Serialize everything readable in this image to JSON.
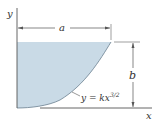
{
  "diagram": {
    "axis_labels": {
      "x": "x",
      "y": "y"
    },
    "dimensions": {
      "width": "a",
      "height": "b"
    },
    "curve": {
      "equation_prefix": "y = kx",
      "exponent": "3/2"
    },
    "colors": {
      "fill": "#c9dae6",
      "stroke": "#555555",
      "text": "#333333"
    }
  }
}
